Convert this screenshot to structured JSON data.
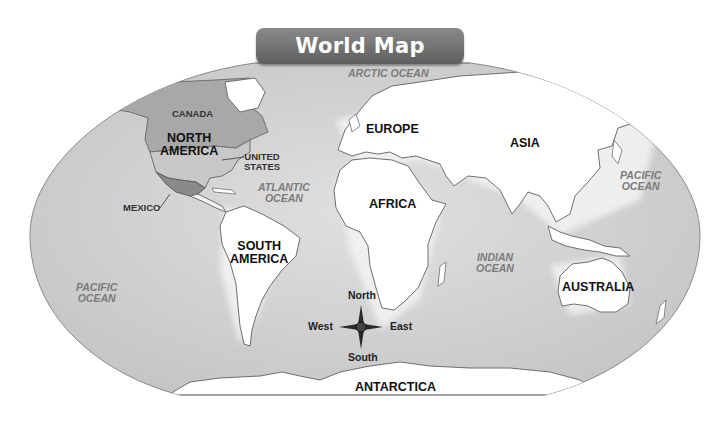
{
  "title": "World Map",
  "colors": {
    "ocean": "#d0d0d0",
    "land": "#ffffff",
    "highlight_land": "#8e8e8e",
    "usa_land": "#c4c4c4",
    "coastline": "#707070",
    "title_banner": "#707070",
    "title_text": "#ffffff"
  },
  "labels": {
    "oceans": {
      "arctic": "ARCTIC OCEAN",
      "atlantic_1": "ATLANTIC",
      "atlantic_2": "OCEAN",
      "pacific_west_1": "PACIFIC",
      "pacific_west_2": "OCEAN",
      "pacific_east_1": "PACIFIC",
      "pacific_east_2": "OCEAN",
      "indian_1": "INDIAN",
      "indian_2": "OCEAN"
    },
    "continents": {
      "north_america_1": "NORTH",
      "north_america_2": "AMERICA",
      "south_america_1": "SOUTH",
      "south_america_2": "AMERICA",
      "europe": "EUROPE",
      "asia": "ASIA",
      "africa": "AFRICA",
      "australia": "AUSTRALIA",
      "antarctica": "ANTARCTICA"
    },
    "countries": {
      "canada": "CANADA",
      "united_states_1": "UNITED",
      "united_states_2": "STATES",
      "mexico": "MEXICO"
    }
  },
  "compass_rose": {
    "north": "North",
    "south": "South",
    "east": "East",
    "west": "West"
  }
}
